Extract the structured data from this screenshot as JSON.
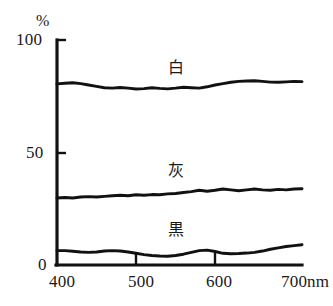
{
  "figure": {
    "unit_label": "%",
    "background_color": "#ffffff",
    "ink_color": "#111111"
  },
  "axes": {
    "y_ticks": [
      {
        "value": 100,
        "label": "100"
      },
      {
        "value": 50,
        "label": "50"
      },
      {
        "value": 0,
        "label": "0"
      }
    ],
    "x_ticks": [
      {
        "value": 400,
        "label": "400"
      },
      {
        "value": 500,
        "label": "500"
      },
      {
        "value": 600,
        "label": "600"
      },
      {
        "value": 700,
        "label": "700nm"
      }
    ]
  },
  "series_labels": {
    "white": "白",
    "gray": "灰",
    "black": "黒"
  },
  "chart_data": {
    "type": "line",
    "title": "",
    "xlabel": "",
    "ylabel": "%",
    "xlim": [
      390,
      700
    ],
    "ylim": [
      0,
      100
    ],
    "grid": false,
    "legend": "inline-annotations",
    "x": [
      390,
      400,
      410,
      420,
      430,
      440,
      450,
      460,
      470,
      480,
      490,
      500,
      510,
      520,
      530,
      540,
      550,
      560,
      570,
      580,
      590,
      600,
      610,
      620,
      630,
      640,
      650,
      660,
      670,
      680,
      690,
      700
    ],
    "series": [
      {
        "name": "白",
        "name_en": "white",
        "color": "#111111",
        "values": [
          80.5,
          80.8,
          81.0,
          80.6,
          80.0,
          79.4,
          78.8,
          78.6,
          78.9,
          78.6,
          78.2,
          78.4,
          78.8,
          78.5,
          78.3,
          78.6,
          79.0,
          78.8,
          78.6,
          79.2,
          80.0,
          80.6,
          81.2,
          81.6,
          81.8,
          81.9,
          81.6,
          81.3,
          81.2,
          81.4,
          81.6,
          81.5
        ]
      },
      {
        "name": "灰",
        "name_en": "gray",
        "color": "#111111",
        "values": [
          29.8,
          30.0,
          29.8,
          30.2,
          30.4,
          30.2,
          30.5,
          30.8,
          31.0,
          30.8,
          31.2,
          31.0,
          31.3,
          31.2,
          31.6,
          31.8,
          32.2,
          32.6,
          33.2,
          32.8,
          33.2,
          33.8,
          33.4,
          33.0,
          33.4,
          33.8,
          33.4,
          33.2,
          33.6,
          33.4,
          33.8,
          33.9
        ]
      },
      {
        "name": "黒",
        "name_en": "black",
        "color": "#111111",
        "values": [
          6.4,
          6.4,
          6.1,
          5.8,
          5.6,
          5.8,
          6.2,
          6.4,
          6.2,
          5.8,
          5.2,
          4.6,
          4.2,
          4.0,
          3.9,
          4.2,
          4.8,
          5.6,
          6.4,
          6.6,
          6.0,
          5.2,
          5.0,
          5.1,
          5.3,
          5.6,
          6.2,
          7.0,
          7.6,
          8.2,
          8.6,
          9.0
        ]
      }
    ]
  }
}
